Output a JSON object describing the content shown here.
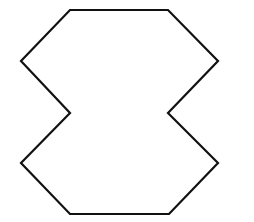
{
  "diagram": {
    "shape": "concave decagon (hourglass-like polygon)",
    "canvas": {
      "width": 254,
      "height": 222
    },
    "background_color": "#ffffff",
    "stroke_color": "#111111",
    "fill_color": "#ffffff",
    "stroke_width": 2.2,
    "vertices": [
      [
        70,
        10
      ],
      [
        168,
        10
      ],
      [
        218,
        61
      ],
      [
        168,
        113
      ],
      [
        218,
        163
      ],
      [
        169,
        214
      ],
      [
        70,
        214
      ],
      [
        21,
        163
      ],
      [
        70,
        113
      ],
      [
        21,
        61
      ]
    ]
  }
}
